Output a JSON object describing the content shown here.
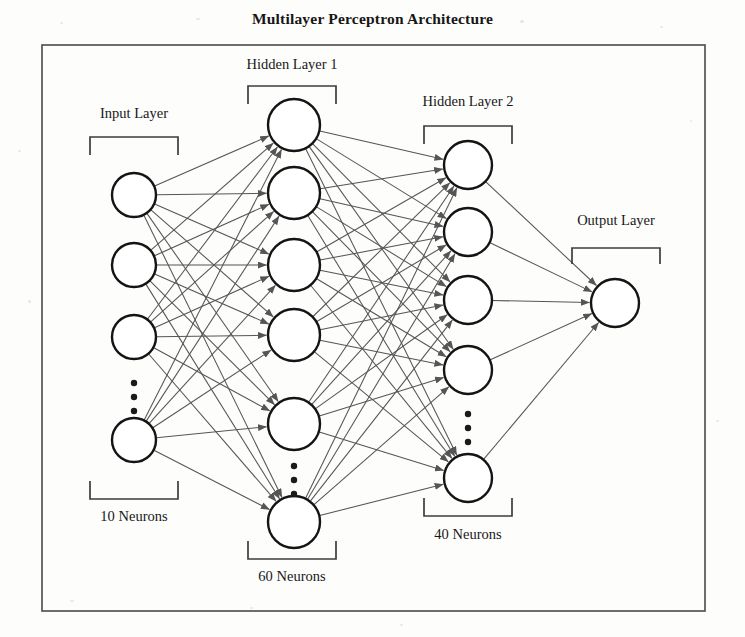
{
  "figure": {
    "title": "Multilayer Perceptron Architecture",
    "frame": {
      "x": 42,
      "y": 45,
      "width": 663,
      "height": 566
    }
  },
  "colors": {
    "background": "#fdfdfc",
    "frame_stroke": "#4a4a4a",
    "node_stroke": "#141414",
    "node_fill": "#ffffff",
    "edge_stroke": "#555555",
    "arrow_fill": "#555555",
    "text": "#181818",
    "bracket_stroke": "#3c3c3c",
    "dot_fill": "#1a1a1a"
  },
  "labels": {
    "input_layer": "Input Layer",
    "hidden_layer_1": "Hidden Layer 1",
    "hidden_layer_2": "Hidden Layer 2",
    "output_layer": "Output Layer",
    "input_count": "10 Neurons",
    "hidden1_count": "60 Neurons",
    "hidden2_count": "40 Neurons"
  },
  "chart_data": {
    "type": "diagram",
    "title": "Multilayer Perceptron Architecture",
    "layers": [
      {
        "name": "Input Layer",
        "neuron_count": 10,
        "count_label": "10 Neurons",
        "drawn_nodes": 4,
        "has_ellipsis": true,
        "ellipsis_after_node": 3,
        "cx": 134,
        "node_radius": 22,
        "node_y": [
          195,
          265,
          337,
          440
        ],
        "ellipsis_y": [
          383,
          397,
          411
        ],
        "top_bracket": {
          "x1": 90,
          "x2": 178,
          "y": 137,
          "tick": 18,
          "orientation": "down"
        },
        "bottom_bracket": {
          "x1": 90,
          "x2": 178,
          "y": 499,
          "tick": 18,
          "orientation": "up"
        },
        "label_xy": [
          134,
          118
        ],
        "count_label_xy": [
          134,
          521
        ]
      },
      {
        "name": "Hidden Layer 1",
        "neuron_count": 60,
        "count_label": "60 Neurons",
        "drawn_nodes": 6,
        "has_ellipsis": true,
        "ellipsis_after_node": 5,
        "cx": 294,
        "node_radius": 26,
        "node_y": [
          125,
          193,
          265,
          335,
          424,
          522
        ],
        "ellipsis_y": [
          466,
          480,
          494
        ],
        "top_bracket": {
          "x1": 248,
          "x2": 336,
          "y": 86,
          "tick": 18,
          "orientation": "down"
        },
        "bottom_bracket": {
          "x1": 248,
          "x2": 336,
          "y": 559,
          "tick": 18,
          "orientation": "up"
        },
        "label_xy": [
          292,
          69
        ],
        "count_label_xy": [
          292,
          581
        ]
      },
      {
        "name": "Hidden Layer 2",
        "neuron_count": 40,
        "count_label": "40 Neurons",
        "drawn_nodes": 5,
        "has_ellipsis": true,
        "ellipsis_after_node": 4,
        "cx": 468,
        "node_radius": 24,
        "node_y": [
          165,
          232,
          300,
          370,
          478
        ],
        "ellipsis_y": [
          414,
          428,
          442
        ],
        "top_bracket": {
          "x1": 424,
          "x2": 512,
          "y": 126,
          "tick": 18,
          "orientation": "down"
        },
        "bottom_bracket": {
          "x1": 424,
          "x2": 512,
          "y": 516,
          "tick": 18,
          "orientation": "up"
        },
        "label_xy": [
          468,
          106
        ],
        "count_label_xy": [
          468,
          539
        ]
      },
      {
        "name": "Output Layer",
        "neuron_count": 1,
        "count_label": "",
        "drawn_nodes": 1,
        "has_ellipsis": false,
        "cx": 615,
        "node_radius": 24,
        "node_y": [
          303
        ],
        "top_bracket": {
          "x1": 572,
          "x2": 660,
          "y": 248,
          "tick": 16,
          "orientation": "down"
        },
        "label_xy": [
          616,
          225
        ]
      }
    ],
    "connections": [
      {
        "from": "Input Layer",
        "to": "Hidden Layer 1",
        "style": "fully-connected",
        "arrowheads": true
      },
      {
        "from": "Hidden Layer 1",
        "to": "Hidden Layer 2",
        "style": "fully-connected",
        "arrowheads": true
      },
      {
        "from": "Hidden Layer 2",
        "to": "Output Layer",
        "style": "fully-connected",
        "arrowheads": true
      }
    ]
  }
}
